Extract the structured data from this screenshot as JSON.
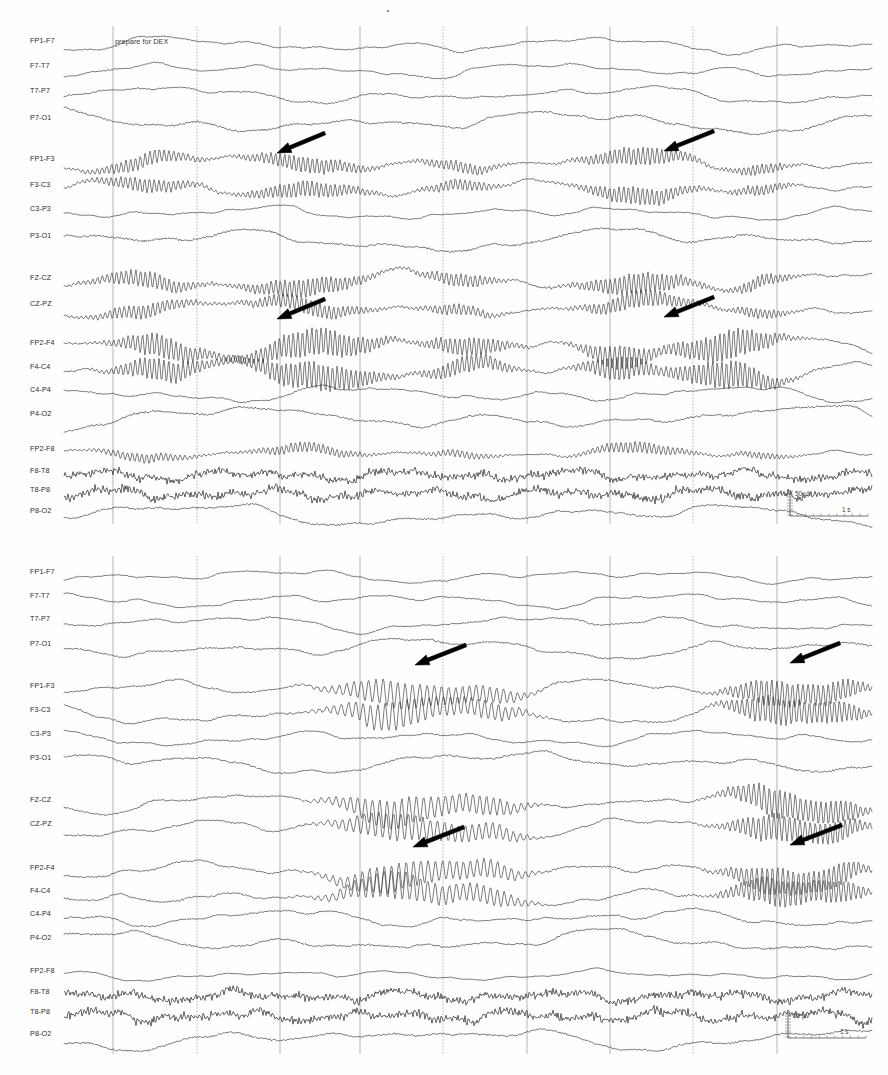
{
  "document": {
    "title": "EEG Recording — Bipolar Longitudinal Montage",
    "width": 888,
    "height": 1075,
    "background_color": "#ffffff",
    "trace_color": "#2f2f2f",
    "gridline_color": "#9a9a9a",
    "arrow_color": "#000000"
  },
  "chart_data": {
    "type": "line",
    "xlabel": "Time",
    "ylabel": "Amplitude",
    "grid": true,
    "legend": "none",
    "scale": {
      "amplitude_label": "50 µV",
      "time_label": "1 s",
      "amplitude_value": 50,
      "amplitude_unit": "µV",
      "time_value": 1,
      "time_unit": "s"
    },
    "gridline_x_positions": [
      113,
      197,
      280,
      360,
      443,
      527,
      610,
      693,
      777
    ],
    "panels": [
      {
        "id": "panel-top",
        "name": "upper-epoch",
        "y": 18,
        "height": 512,
        "plot_left": 60,
        "plot_right": 872,
        "annotations": [
          {
            "type": "event-marker",
            "label": "prepare for DEX",
            "x": 113,
            "y": 44
          }
        ],
        "arrows": [
          {
            "id": "arrow-top-left-upper",
            "tip_x": 277,
            "tip_y": 153,
            "tail_x": 325,
            "tail_y": 133
          },
          {
            "id": "arrow-top-right-upper",
            "tip_x": 664,
            "tip_y": 151,
            "tail_x": 714,
            "tail_y": 131
          },
          {
            "id": "arrow-top-left-lower",
            "tip_x": 277,
            "tip_y": 319,
            "tail_x": 325,
            "tail_y": 299
          },
          {
            "id": "arrow-top-right-lower",
            "tip_x": 664,
            "tip_y": 317,
            "tail_x": 714,
            "tail_y": 297
          }
        ],
        "channels": [
          {
            "label": "FP1-F7",
            "y": 45,
            "amp": 4.2,
            "freq": 1.0,
            "seed": 11,
            "style": "normal"
          },
          {
            "label": "F7-T7",
            "y": 70,
            "amp": 4.0,
            "freq": 1.1,
            "seed": 12,
            "style": "normal"
          },
          {
            "label": "T7-P7",
            "y": 95,
            "amp": 4.6,
            "freq": 0.9,
            "seed": 13,
            "style": "normal"
          },
          {
            "label": "P7-O1",
            "y": 122,
            "amp": 6.0,
            "freq": 0.8,
            "seed": 14,
            "style": "normal"
          },
          {
            "label": "FP1-F3",
            "y": 163,
            "amp": 4.6,
            "freq": 1.0,
            "seed": 15,
            "style": "spindle"
          },
          {
            "label": "F3-C3",
            "y": 189,
            "amp": 4.6,
            "freq": 1.05,
            "seed": 16,
            "style": "spindle"
          },
          {
            "label": "C3-P3",
            "y": 213,
            "amp": 3.6,
            "freq": 1.15,
            "seed": 17,
            "style": "normal"
          },
          {
            "label": "P3-O1",
            "y": 240,
            "amp": 6.2,
            "freq": 0.72,
            "seed": 18,
            "style": "normal"
          },
          {
            "label": "FZ-CZ",
            "y": 282,
            "amp": 5.4,
            "freq": 0.95,
            "seed": 19,
            "style": "spindle"
          },
          {
            "label": "CZ-PZ",
            "y": 308,
            "amp": 4.6,
            "freq": 1.0,
            "seed": 20,
            "style": "spindle"
          },
          {
            "label": "FP2-F4",
            "y": 347,
            "amp": 5.6,
            "freq": 1.0,
            "seed": 21,
            "style": "spindle-strong"
          },
          {
            "label": "F4-C4",
            "y": 371,
            "amp": 5.4,
            "freq": 1.05,
            "seed": 22,
            "style": "spindle-strong"
          },
          {
            "label": "C4-P4",
            "y": 394,
            "amp": 4.4,
            "freq": 1.1,
            "seed": 23,
            "style": "normal"
          },
          {
            "label": "P4-O2",
            "y": 418,
            "amp": 6.2,
            "freq": 0.75,
            "seed": 24,
            "style": "normal"
          },
          {
            "label": "FP2-F8",
            "y": 453,
            "amp": 3.0,
            "freq": 1.2,
            "seed": 25,
            "style": "spindle"
          },
          {
            "label": "F8-T8",
            "y": 475,
            "amp": 3.0,
            "freq": 2.4,
            "seed": 26,
            "style": "emg"
          },
          {
            "label": "T8-P8",
            "y": 494,
            "amp": 3.2,
            "freq": 2.6,
            "seed": 27,
            "style": "emg"
          },
          {
            "label": "P8-O2",
            "y": 515,
            "amp": 6.0,
            "freq": 0.78,
            "seed": 28,
            "style": "normal"
          }
        ],
        "scale_bar": {
          "x": 790,
          "y": 490,
          "label_amp": "50 µV",
          "label_time": "1 s"
        }
      },
      {
        "id": "panel-bottom",
        "name": "lower-epoch",
        "y": 548,
        "height": 512,
        "plot_left": 60,
        "plot_right": 872,
        "annotations": [],
        "arrows": [
          {
            "id": "arrow-bottom-left-upper",
            "tip_x": 415,
            "tip_y": 665,
            "tail_x": 466,
            "tail_y": 645
          },
          {
            "id": "arrow-bottom-right-upper",
            "tip_x": 790,
            "tip_y": 663,
            "tail_x": 840,
            "tail_y": 643
          },
          {
            "id": "arrow-bottom-left-lower",
            "tip_x": 413,
            "tip_y": 847,
            "tail_x": 464,
            "tail_y": 827
          },
          {
            "id": "arrow-bottom-right-lower",
            "tip_x": 790,
            "tip_y": 845,
            "tail_x": 842,
            "tail_y": 825
          }
        ],
        "channels": [
          {
            "label": "FP1-F7",
            "y": 576,
            "amp": 3.6,
            "freq": 1.1,
            "seed": 31,
            "style": "normal"
          },
          {
            "label": "F7-T7",
            "y": 600,
            "amp": 3.8,
            "freq": 1.15,
            "seed": 32,
            "style": "normal"
          },
          {
            "label": "T7-P7",
            "y": 623,
            "amp": 4.4,
            "freq": 1.0,
            "seed": 33,
            "style": "normal"
          },
          {
            "label": "P7-O1",
            "y": 648,
            "amp": 5.6,
            "freq": 0.82,
            "seed": 34,
            "style": "normal"
          },
          {
            "label": "FP1-F3",
            "y": 690,
            "amp": 5.2,
            "freq": 0.92,
            "seed": 35,
            "style": "burst"
          },
          {
            "label": "F3-C3",
            "y": 714,
            "amp": 5.4,
            "freq": 0.95,
            "seed": 36,
            "style": "burst"
          },
          {
            "label": "C3-P3",
            "y": 738,
            "amp": 4.2,
            "freq": 1.05,
            "seed": 37,
            "style": "normal"
          },
          {
            "label": "P3-O1",
            "y": 762,
            "amp": 5.8,
            "freq": 0.78,
            "seed": 38,
            "style": "normal"
          },
          {
            "label": "FZ-CZ",
            "y": 804,
            "amp": 5.6,
            "freq": 0.9,
            "seed": 39,
            "style": "burst"
          },
          {
            "label": "CZ-PZ",
            "y": 828,
            "amp": 5.2,
            "freq": 0.95,
            "seed": 40,
            "style": "burst"
          },
          {
            "label": "FP2-F4",
            "y": 872,
            "amp": 5.4,
            "freq": 0.95,
            "seed": 41,
            "style": "burst"
          },
          {
            "label": "F4-C4",
            "y": 895,
            "amp": 5.4,
            "freq": 1.0,
            "seed": 42,
            "style": "burst"
          },
          {
            "label": "C4-P4",
            "y": 918,
            "amp": 4.6,
            "freq": 1.05,
            "seed": 43,
            "style": "normal"
          },
          {
            "label": "P4-O2",
            "y": 942,
            "amp": 5.8,
            "freq": 0.8,
            "seed": 44,
            "style": "normal"
          },
          {
            "label": "FP2-F8",
            "y": 975,
            "amp": 2.8,
            "freq": 1.25,
            "seed": 45,
            "style": "normal"
          },
          {
            "label": "F8-T8",
            "y": 996,
            "amp": 3.0,
            "freq": 2.5,
            "seed": 46,
            "style": "emg"
          },
          {
            "label": "T8-P8",
            "y": 1016,
            "amp": 3.2,
            "freq": 2.7,
            "seed": 47,
            "style": "emg"
          },
          {
            "label": "P8-O2",
            "y": 1038,
            "amp": 6.0,
            "freq": 0.76,
            "seed": 48,
            "style": "normal"
          }
        ],
        "scale_bar": {
          "x": 788,
          "y": 1012,
          "label_amp": "50 µV",
          "label_time": "1 s"
        }
      }
    ]
  }
}
